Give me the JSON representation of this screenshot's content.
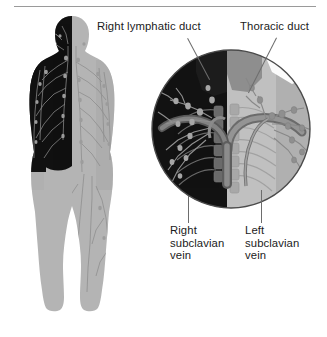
{
  "figure": {
    "title_rule": true,
    "background_color": "#ffffff",
    "line_color": "#6d6d6d",
    "text_color": "#1b1b1b",
    "body_dark_color": "#111111",
    "body_light_color": "#b4b4b4",
    "body_mid_color": "#8e8e8e",
    "vessel_color": "#7d7d7d",
    "circle_border_color": "#4b4b4b"
  },
  "labels": {
    "right_lymphatic_duct": "Right lymphatic duct",
    "thoracic_duct": "Thoracic duct",
    "right_subclavian_vein": "Right\nsubclavian\nvein",
    "left_subclavian_vein": "Left\nsubclavian\nvein"
  },
  "inset": {
    "shape": "circle",
    "center_x": 231,
    "center_y": 129,
    "radius": 79,
    "description": "magnified view of the junction of the lymphatic ducts with the subclavian veins"
  },
  "body_figure": {
    "description": "anterior human figure, left half rendered dark, right half rendered light, showing lymphatic vessels and nodes",
    "x": 26,
    "y": 16,
    "width": 115,
    "height": 296
  }
}
